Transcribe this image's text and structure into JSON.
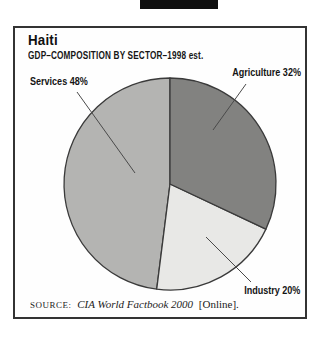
{
  "chart_data": {
    "type": "pie",
    "title": "Haiti",
    "subtitle": "GDP–COMPOSITION BY SECTOR–1998 est.",
    "categories": [
      "Agriculture",
      "Industry",
      "Services"
    ],
    "values": [
      32,
      20,
      48
    ],
    "unit": "%",
    "labels": [
      "Agriculture 32%",
      "Industry 20%",
      "Services 48%"
    ],
    "slice_colors": [
      "#828280",
      "#e8e8e6",
      "#b4b4b2"
    ],
    "outline_color": "#3a3a3a",
    "leader_line_color": "#4a4a4a",
    "start_at": "top",
    "direction": "clockwise",
    "legend": "none",
    "source": "SOURCE: CIA World Factbook 2000 [Online]."
  },
  "source": {
    "prefix": "SOURCE:",
    "work": "CIA World Factbook 2000",
    "suffix": "[Online]."
  }
}
